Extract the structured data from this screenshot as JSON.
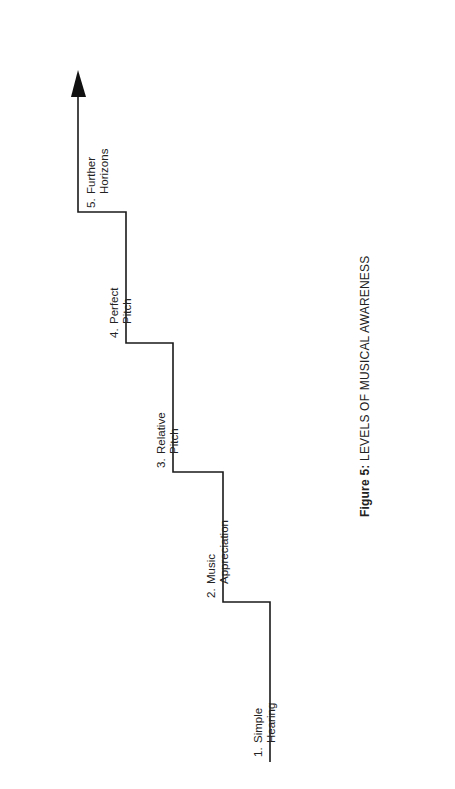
{
  "figure": {
    "caption_prefix": "Figure 5:",
    "caption_text": " LEVELS OF MUSICAL AWARENESS"
  },
  "steps": [
    {
      "number": "1.",
      "line1": "Simple",
      "line2": "Hearing"
    },
    {
      "number": "2.",
      "line1": "Music",
      "line2": "Appreciation"
    },
    {
      "number": "3.",
      "line1": "Relative",
      "line2": "Pitch"
    },
    {
      "number": "4.",
      "line1": "Perfect",
      "line2": "Pitch"
    },
    {
      "number": "5.",
      "line1": "Further",
      "line2": "Horizons"
    }
  ],
  "colors": {
    "line": "#1a1a1a",
    "background": "#ffffff"
  }
}
